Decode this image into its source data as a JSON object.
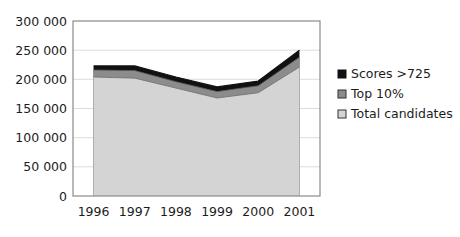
{
  "chart_data": {
    "type": "area",
    "stacked": true,
    "title": "",
    "xlabel": "",
    "ylabel": "",
    "categories": [
      "1996",
      "1997",
      "1998",
      "1999",
      "2000",
      "2001"
    ],
    "ylim": [
      0,
      300000
    ],
    "yticks": [
      0,
      50000,
      100000,
      150000,
      200000,
      250000,
      300000
    ],
    "ytick_labels": [
      "0",
      "50 000",
      "100 000",
      "150 000",
      "200 000",
      "250 000",
      "300 000"
    ],
    "grid": true,
    "legend_position": "right",
    "series": [
      {
        "name": "Total candidates",
        "color": "#d4d4d4",
        "values": [
          204000,
          202000,
          185000,
          168000,
          177000,
          221000
        ]
      },
      {
        "name": "Top 10%",
        "color": "#8c8c8c",
        "values": [
          216000,
          215000,
          196000,
          179000,
          189000,
          238000
        ]
      },
      {
        "name": "Scores >725",
        "color": "#111111",
        "values": [
          223000,
          223000,
          204000,
          187000,
          197000,
          250000
        ]
      }
    ],
    "legend_entries": [
      {
        "label": "Scores >725",
        "color": "#111111",
        "marker": "filled-square"
      },
      {
        "label": "Top 10%",
        "color": "#8c8c8c",
        "marker": "square-outline"
      },
      {
        "label": "Total candidates",
        "color": "#d4d4d4",
        "marker": "square-outline"
      }
    ]
  },
  "axes": {
    "plot_border_color": "#8a8a8a",
    "gridline_color": "#d9d9d9",
    "background_color": "#ffffff"
  }
}
